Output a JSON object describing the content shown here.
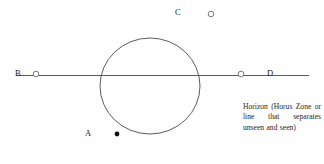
{
  "diagram": {
    "background_color": "#fefefe",
    "stroke_color": "#4a4a4a",
    "text_color": "#232323",
    "horizon_line": {
      "label_name": "horizon-line",
      "y": 75,
      "x_start": 16,
      "x_end": 309
    },
    "sphere": {
      "label_name": "earth-circle",
      "center_x": 150,
      "center_y": 86,
      "radius_x": 50,
      "radius_y": 48
    },
    "points": [
      {
        "id": "A",
        "label": "A",
        "marker": "filled-dot",
        "marker_x": 117,
        "marker_y": 134,
        "label_x": 85,
        "label_y": 129,
        "position_note": "below horizon"
      },
      {
        "id": "B",
        "label": "B",
        "marker": "open-circle",
        "marker_x": 36,
        "marker_y": 74,
        "label_x": 15,
        "label_y": 69,
        "position_note": "on horizon, left"
      },
      {
        "id": "C",
        "label": "C",
        "marker": "open-circle",
        "marker_x": 211,
        "marker_y": 14,
        "label_x": 175,
        "label_y": 8,
        "position_note": "above horizon"
      },
      {
        "id": "D",
        "label": "D",
        "marker": "open-circle",
        "marker_x": 241,
        "marker_y": 74,
        "label_x": 267,
        "label_y": 69,
        "position_note": "on horizon, right"
      }
    ],
    "caption": "Horizon (Horus Zone or line that separates unseen and seen)"
  }
}
